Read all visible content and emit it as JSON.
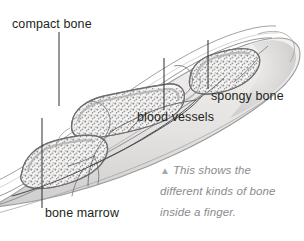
{
  "figure": {
    "labels": [
      {
        "id": "compact-bone",
        "text": "compact bone"
      },
      {
        "id": "spongy-bone",
        "text": "spongy bone"
      },
      {
        "id": "blood-vessels",
        "text": "blood vessels"
      },
      {
        "id": "bone-marrow",
        "text": "bone marrow"
      }
    ],
    "caption": {
      "marker": "▲",
      "lines": [
        "This shows the",
        "different kinds of bone",
        "inside a finger."
      ],
      "full_text": "This shows the different kinds of bone inside a finger."
    },
    "colors": {
      "label_text": "#231f20",
      "caption_text": "#8b8b8d",
      "caption_marker": "#a8a8aa",
      "leader_line": "#3a3a3c",
      "background": "#ffffff",
      "skin_fill": "#e8e7e6",
      "skin_outline": "#9a9a9c",
      "bone_fill": "#f4f3f2",
      "bone_outline": "#6f6f71",
      "spongy_speckle": "#8d8d8f",
      "vessel_line": "#55555a"
    }
  }
}
